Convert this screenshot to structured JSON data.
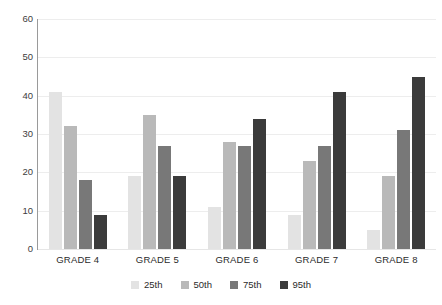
{
  "chart_data": {
    "type": "bar",
    "title": "",
    "subtitle": "",
    "xlabel": "",
    "ylabel": "",
    "categories": [
      "GRADE 4",
      "GRADE 5",
      "GRADE 6",
      "GRADE 7",
      "GRADE 8"
    ],
    "series": [
      {
        "name": "25th",
        "color": "#e3e3e3",
        "values": [
          41,
          19,
          11,
          9,
          5
        ]
      },
      {
        "name": "50th",
        "color": "#b9b9b9",
        "values": [
          32,
          35,
          28,
          23,
          19
        ]
      },
      {
        "name": "75th",
        "color": "#787878",
        "values": [
          18,
          27,
          27,
          27,
          31
        ]
      },
      {
        "name": "95th",
        "color": "#3b3b3b",
        "values": [
          9,
          19,
          34,
          41,
          45
        ]
      }
    ],
    "ylim": [
      0,
      60
    ],
    "y_ticks": [
      0,
      10,
      20,
      30,
      40,
      50,
      60
    ],
    "y_tick_labels": [
      "0",
      "10",
      "20",
      "30",
      "40",
      "50",
      "60"
    ],
    "grid": "horizontal",
    "legend_position": "bottom-center",
    "grid_color": "#ededed",
    "axis_color": "#9a9a9a",
    "background": "#ffffff"
  }
}
